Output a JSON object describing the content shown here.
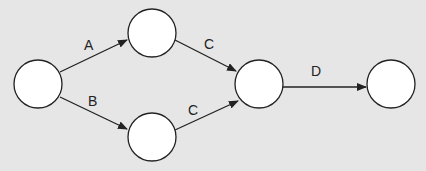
{
  "diagram": {
    "type": "activity-on-arrow network",
    "colors": {
      "background": "#e6e6e6",
      "node_fill": "#ffffff",
      "stroke": "#222222"
    },
    "nodes": [
      {
        "id": "n1",
        "cx": 38,
        "cy": 84,
        "r": 24,
        "label": ""
      },
      {
        "id": "n2",
        "cx": 152,
        "cy": 33,
        "r": 24,
        "label": ""
      },
      {
        "id": "n3",
        "cx": 152,
        "cy": 137,
        "r": 24,
        "label": ""
      },
      {
        "id": "n4",
        "cx": 259,
        "cy": 84,
        "r": 24,
        "label": ""
      },
      {
        "id": "n5",
        "cx": 391,
        "cy": 84,
        "r": 24,
        "label": ""
      }
    ],
    "edges": [
      {
        "from": "n1",
        "to": "n2",
        "label": "A"
      },
      {
        "from": "n1",
        "to": "n3",
        "label": "B"
      },
      {
        "from": "n2",
        "to": "n4",
        "label": "C"
      },
      {
        "from": "n3",
        "to": "n4",
        "label": "C"
      },
      {
        "from": "n4",
        "to": "n5",
        "label": "D"
      }
    ]
  }
}
